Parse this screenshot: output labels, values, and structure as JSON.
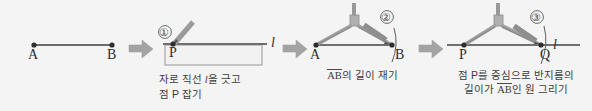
{
  "figure": {
    "background_color": "#f4f4f4",
    "ink_color": "#4a4a4a",
    "tool_color": "#8f8f8f",
    "arrow_color": "#9a9a9a",
    "panel_count": 4,
    "arrow_icon_name": "right-arrow-icon"
  },
  "panels": [
    {
      "id": "panel-given-segment",
      "step_number": "",
      "points": [
        {
          "name": "A",
          "label": "A"
        },
        {
          "name": "B",
          "label": "B"
        }
      ],
      "line_label": "",
      "caption_lines": [],
      "tools": []
    },
    {
      "id": "panel-draw-line",
      "step_number": "①",
      "points": [
        {
          "name": "P",
          "label": "P"
        }
      ],
      "line_label": "l",
      "caption_lines": [
        {
          "pre": "자로 직선 ",
          "ital": "l",
          "post": "을 긋고"
        },
        {
          "pre": "점 P 잡기",
          "ital": "",
          "post": ""
        }
      ],
      "tools": [
        "ruler",
        "pencil"
      ]
    },
    {
      "id": "panel-measure-ab",
      "step_number": "②",
      "points": [
        {
          "name": "A",
          "label": "A"
        },
        {
          "name": "B",
          "label": "B"
        }
      ],
      "line_label": "",
      "caption_lines": [
        {
          "overline": "AB",
          "rest": "의 길이 재기"
        }
      ],
      "tools": [
        "compass",
        "pencil"
      ]
    },
    {
      "id": "panel-draw-circle",
      "step_number": "③",
      "points": [
        {
          "name": "P",
          "label": "P"
        },
        {
          "name": "Q",
          "label": "Q"
        }
      ],
      "line_label": "l",
      "caption_lines": [
        {
          "pre": "점 P를 중심으로 반지름의",
          "ital": "",
          "post": ""
        },
        {
          "pre": "길이가 ",
          "overline": "AB",
          "post": "인 원 그리기"
        }
      ],
      "tools": [
        "compass",
        "pencil"
      ]
    }
  ],
  "captions": {
    "panel2_line1_pre": "자로 직선 ",
    "panel2_line1_ital": "l",
    "panel2_line1_post": "을 긋고",
    "panel2_line2": "점 P 잡기",
    "panel3_line1_overline": "AB",
    "panel3_line1_rest": "의 길이 재기",
    "panel4_line1": "점 P를 중심으로 반지름의",
    "panel4_line2_pre": "길이가 ",
    "panel4_line2_overline": "AB",
    "panel4_line2_post": "인 원 그리기"
  },
  "labels": {
    "p1_A": "A",
    "p1_B": "B",
    "p2_P": "P",
    "p2_l": "l",
    "p2_num": "①",
    "p3_A": "A",
    "p3_B": "B",
    "p3_num": "②",
    "p4_P": "P",
    "p4_Q": "Q",
    "p4_l": "l",
    "p4_num": "③"
  }
}
